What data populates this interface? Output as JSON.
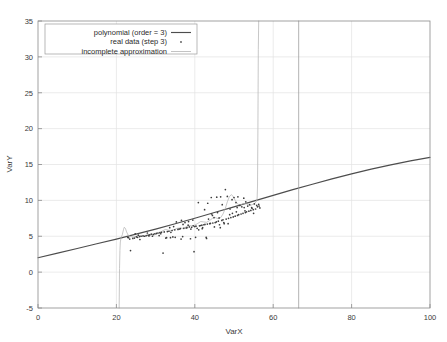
{
  "chart_data": {
    "type": "scatter",
    "title": "",
    "xlabel": "VarX",
    "ylabel": "VarY",
    "xlim": [
      0,
      100
    ],
    "ylim": [
      -5,
      35
    ],
    "xticks": [
      0,
      20,
      40,
      60,
      80,
      100
    ],
    "yticks": [
      -5,
      0,
      5,
      10,
      15,
      20,
      25,
      30,
      35
    ],
    "xtick_labels": [
      "0",
      "20",
      "40",
      "60",
      "80",
      "100"
    ],
    "ytick_labels": [
      "-5",
      "0",
      "5",
      "10",
      "15",
      "20",
      "25",
      "30",
      "35"
    ],
    "grid": true,
    "legend_position": "upper-left",
    "legend": [
      {
        "label": "polynomial (order = 3)",
        "marker": "line",
        "color": "#4d4d4d"
      },
      {
        "label": "real data (step 3)",
        "marker": "dot",
        "color": "#555555"
      },
      {
        "label": "incomplete approximation",
        "marker": "line",
        "color": "#b4b4b4"
      }
    ],
    "series": [
      {
        "name": "polynomial (order = 3)",
        "type": "line",
        "color": "#4d4d4d",
        "points": [
          [
            0,
            2.0
          ],
          [
            5,
            2.65
          ],
          [
            10,
            3.3
          ],
          [
            15,
            3.95
          ],
          [
            20,
            4.6
          ],
          [
            25,
            5.3
          ],
          [
            30,
            6.0
          ],
          [
            35,
            6.75
          ],
          [
            40,
            7.5
          ],
          [
            45,
            8.3
          ],
          [
            50,
            9.1
          ],
          [
            55,
            9.9
          ],
          [
            60,
            10.7
          ],
          [
            65,
            11.5
          ],
          [
            70,
            12.25
          ],
          [
            75,
            13.0
          ],
          [
            80,
            13.7
          ],
          [
            85,
            14.35
          ],
          [
            90,
            14.95
          ],
          [
            95,
            15.5
          ],
          [
            100,
            16.0
          ]
        ]
      },
      {
        "name": "incomplete approximation",
        "type": "line",
        "color": "#b4b4b4",
        "points": [
          [
            20.7,
            -5.0
          ],
          [
            20.8,
            0.5
          ],
          [
            20.9,
            3.0
          ],
          [
            21.0,
            4.2
          ],
          [
            21.2,
            4.8
          ],
          [
            21.5,
            5.2
          ],
          [
            21.8,
            5.9
          ],
          [
            22.0,
            6.25
          ],
          [
            22.3,
            6.1
          ],
          [
            22.6,
            5.6
          ],
          [
            23.0,
            5.15
          ],
          [
            23.6,
            4.95
          ],
          [
            24.3,
            4.9
          ],
          [
            25.0,
            5.0
          ],
          [
            25.8,
            5.1
          ],
          [
            26.5,
            5.05
          ],
          [
            27.2,
            5.0
          ],
          [
            28.0,
            5.1
          ],
          [
            28.8,
            5.2
          ],
          [
            29.5,
            5.15
          ],
          [
            30.2,
            5.3
          ],
          [
            31.0,
            5.5
          ],
          [
            31.8,
            5.75
          ],
          [
            32.5,
            5.95
          ],
          [
            33.2,
            5.85
          ],
          [
            34.0,
            5.8
          ],
          [
            34.8,
            5.95
          ],
          [
            35.5,
            6.1
          ],
          [
            36.2,
            6.15
          ],
          [
            37.0,
            6.1
          ],
          [
            37.8,
            6.3
          ],
          [
            38.5,
            6.5
          ],
          [
            39.2,
            6.45
          ],
          [
            40.0,
            6.55
          ],
          [
            40.8,
            6.8
          ],
          [
            41.5,
            7.05
          ],
          [
            42.2,
            7.0
          ],
          [
            43.0,
            6.95
          ],
          [
            43.8,
            7.2
          ],
          [
            44.5,
            7.5
          ],
          [
            45.2,
            7.6
          ],
          [
            46.0,
            7.45
          ],
          [
            46.6,
            7.6
          ],
          [
            47.2,
            8.1
          ],
          [
            47.8,
            8.9
          ],
          [
            48.3,
            9.8
          ],
          [
            48.8,
            10.5
          ],
          [
            49.3,
            10.8
          ],
          [
            49.8,
            10.55
          ],
          [
            50.3,
            10.0
          ],
          [
            50.9,
            9.5
          ],
          [
            51.5,
            9.35
          ],
          [
            52.2,
            9.5
          ],
          [
            52.9,
            9.6
          ],
          [
            53.5,
            9.4
          ],
          [
            54.2,
            9.3
          ],
          [
            54.8,
            9.45
          ],
          [
            55.3,
            9.6
          ],
          [
            55.7,
            9.8
          ],
          [
            55.9,
            10.3
          ],
          [
            56.0,
            12.0
          ],
          [
            56.1,
            20.0
          ],
          [
            56.2,
            31.0
          ],
          [
            56.3,
            35.0
          ]
        ]
      },
      {
        "name": "vertical marker",
        "type": "line",
        "color": "#9a9a9a",
        "points": [
          [
            66.5,
            -5.0
          ],
          [
            66.5,
            35.0
          ]
        ]
      },
      {
        "name": "real data (step 3)",
        "type": "scatter",
        "color": "#3c3c3c",
        "points": [
          [
            23.1,
            4.8
          ],
          [
            23.4,
            4.6
          ],
          [
            23.6,
            3.0
          ],
          [
            24.2,
            4.7
          ],
          [
            24.6,
            4.75
          ],
          [
            25.1,
            4.9
          ],
          [
            25.4,
            4.85
          ],
          [
            25.9,
            4.95
          ],
          [
            26.3,
            5.0
          ],
          [
            26.8,
            5.05
          ],
          [
            27.2,
            5.0
          ],
          [
            27.6,
            5.1
          ],
          [
            28.1,
            5.15
          ],
          [
            28.5,
            5.2
          ],
          [
            28.9,
            5.3
          ],
          [
            29.4,
            5.25
          ],
          [
            29.8,
            5.35
          ],
          [
            30.2,
            5.4
          ],
          [
            30.6,
            5.45
          ],
          [
            31.1,
            5.5
          ],
          [
            31.5,
            5.55
          ],
          [
            31.9,
            2.65
          ],
          [
            32.2,
            5.6
          ],
          [
            32.6,
            4.75
          ],
          [
            33.0,
            5.65
          ],
          [
            33.4,
            5.7
          ],
          [
            33.8,
            4.8
          ],
          [
            34.2,
            5.8
          ],
          [
            34.6,
            6.35
          ],
          [
            34.9,
            5.9
          ],
          [
            35.3,
            7.0
          ],
          [
            35.7,
            5.95
          ],
          [
            36.0,
            6.0
          ],
          [
            36.3,
            6.05
          ],
          [
            36.6,
            7.2
          ],
          [
            36.9,
            4.95
          ],
          [
            37.2,
            6.1
          ],
          [
            37.5,
            6.9
          ],
          [
            37.8,
            6.15
          ],
          [
            38.0,
            6.2
          ],
          [
            38.3,
            6.55
          ],
          [
            38.6,
            6.3
          ],
          [
            38.9,
            4.65
          ],
          [
            39.2,
            6.25
          ],
          [
            39.5,
            7.25
          ],
          [
            39.8,
            2.85
          ],
          [
            40.0,
            6.35
          ],
          [
            40.3,
            6.4
          ],
          [
            40.6,
            6.1
          ],
          [
            40.9,
            9.7
          ],
          [
            41.2,
            6.45
          ],
          [
            41.5,
            6.5
          ],
          [
            41.8,
            6.55
          ],
          [
            42.0,
            6.2
          ],
          [
            42.3,
            6.6
          ],
          [
            42.6,
            6.65
          ],
          [
            42.9,
            4.85
          ],
          [
            43.2,
            6.7
          ],
          [
            43.5,
            7.4
          ],
          [
            43.8,
            6.75
          ],
          [
            44.0,
            6.8
          ],
          [
            44.3,
            8.1
          ],
          [
            44.6,
            6.85
          ],
          [
            44.9,
            7.6
          ],
          [
            45.2,
            6.9
          ],
          [
            45.5,
            7.0
          ],
          [
            45.8,
            8.3
          ],
          [
            46.0,
            7.1
          ],
          [
            46.3,
            6.6
          ],
          [
            46.6,
            10.5
          ],
          [
            46.9,
            7.2
          ],
          [
            47.2,
            7.3
          ],
          [
            47.5,
            6.75
          ],
          [
            47.8,
            11.5
          ],
          [
            48.0,
            7.4
          ],
          [
            48.3,
            10.55
          ],
          [
            48.6,
            7.5
          ],
          [
            48.9,
            8.0
          ],
          [
            49.2,
            7.6
          ],
          [
            49.5,
            10.1
          ],
          [
            49.8,
            7.7
          ],
          [
            50.0,
            10.4
          ],
          [
            50.3,
            7.8
          ],
          [
            50.6,
            8.4
          ],
          [
            50.9,
            7.9
          ],
          [
            51.2,
            8.0
          ],
          [
            51.5,
            9.3
          ],
          [
            51.8,
            8.1
          ],
          [
            52.0,
            9.1
          ],
          [
            52.3,
            8.2
          ],
          [
            52.6,
            9.0
          ],
          [
            52.9,
            8.3
          ],
          [
            53.2,
            8.4
          ],
          [
            53.5,
            9.2
          ],
          [
            53.8,
            8.5
          ],
          [
            54.0,
            9.4
          ],
          [
            54.3,
            8.6
          ],
          [
            54.6,
            8.9
          ],
          [
            54.9,
            8.7
          ],
          [
            55.2,
            9.5
          ],
          [
            55.5,
            8.8
          ],
          [
            55.8,
            9.3
          ],
          [
            56.0,
            9.1
          ],
          [
            56.3,
            9.45
          ],
          [
            56.6,
            8.95
          ],
          [
            24.8,
            5.35
          ],
          [
            26.0,
            4.55
          ],
          [
            27.9,
            5.45
          ],
          [
            30.9,
            5.1
          ],
          [
            33.6,
            6.2
          ],
          [
            35.0,
            4.85
          ],
          [
            36.5,
            4.6
          ],
          [
            38.4,
            7.05
          ],
          [
            39.0,
            6.0
          ],
          [
            41.0,
            5.9
          ],
          [
            43.0,
            4.7
          ],
          [
            44.5,
            7.9
          ],
          [
            45.0,
            6.3
          ],
          [
            46.5,
            6.2
          ],
          [
            47.0,
            9.4
          ],
          [
            48.5,
            6.75
          ],
          [
            49.0,
            8.8
          ],
          [
            50.5,
            9.7
          ],
          [
            51.0,
            10.5
          ],
          [
            52.5,
            10.3
          ],
          [
            44.2,
            10.4
          ],
          [
            45.6,
            10.45
          ],
          [
            42.5,
            8.7
          ],
          [
            43.3,
            9.6
          ],
          [
            47.4,
            6.9
          ],
          [
            40.2,
            4.85
          ],
          [
            37.0,
            6.65
          ],
          [
            34.4,
            4.9
          ],
          [
            32.8,
            4.8
          ],
          [
            29.2,
            5.0
          ],
          [
            50.8,
            9.0
          ],
          [
            53.0,
            9.8
          ],
          [
            54.5,
            9.0
          ],
          [
            55.0,
            8.2
          ],
          [
            56.4,
            9.2
          ],
          [
            22.9,
            4.85
          ],
          [
            25.6,
            5.15
          ],
          [
            28.3,
            5.05
          ],
          [
            31.3,
            5.35
          ],
          [
            33.9,
            5.55
          ],
          [
            39.6,
            6.45
          ],
          [
            41.9,
            6.05
          ],
          [
            46.2,
            7.55
          ],
          [
            49.6,
            8.2
          ],
          [
            52.8,
            8.55
          ]
        ]
      }
    ]
  }
}
